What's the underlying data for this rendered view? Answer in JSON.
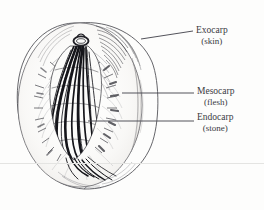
{
  "figure": {
    "background_color": "#fdfdfc",
    "ink_color": "#2b2b30",
    "text_color": "#3a3a42"
  },
  "labels": [
    {
      "id": "exocarp",
      "main": "Exocarp",
      "sub": "(skin)",
      "leader": "diagonal",
      "points_to": "outer-skin-layer"
    },
    {
      "id": "mesocarp",
      "main": "Mesocarp",
      "sub": "(flesh)",
      "leader": "horizontal",
      "points_to": "fleshy-middle-layer"
    },
    {
      "id": "endocarp",
      "main": "Endocarp",
      "sub": "(stone)",
      "leader": "horizontal",
      "points_to": "hard-inner-stone"
    }
  ],
  "parts": {
    "stem_scar": "stem-attachment",
    "cut_face": "cut-face-ellipse",
    "stone": "stone-pit",
    "flesh_fibers": "radiating-flesh-fibers",
    "skin_outline": "outer-skin-outline"
  }
}
